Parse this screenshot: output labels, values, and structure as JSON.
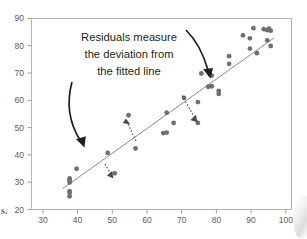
{
  "figure": {
    "background_color": "#ffffff",
    "frame_color": "#b5b5b5",
    "point_color": "#6e6e78",
    "line_color": "#8a8a8a",
    "annotation_color": "#231f20",
    "residual_arrow_color": "#4a4a55"
  },
  "annotation": {
    "line1": "Residuals measure",
    "line2": "the deviation from",
    "line3": "the fitted line",
    "arrow_left_name": "curved-arrow-left",
    "arrow_right_name": "curved-arrow-right"
  },
  "page_artifacts": {
    "text_fragment": "s."
  },
  "chart_data": {
    "type": "scatter",
    "title": "",
    "xlabel": "",
    "ylabel": "",
    "xlim": [
      27,
      102
    ],
    "ylim": [
      18,
      93
    ],
    "xticks": [
      30,
      40,
      50,
      60,
      70,
      80,
      90,
      100
    ],
    "yticks": [
      20,
      30,
      40,
      50,
      60,
      70,
      80,
      90
    ],
    "grid": false,
    "legend": "none",
    "series": [
      {
        "name": "observations",
        "x": [
          38,
          38,
          38,
          38,
          38,
          38,
          40,
          49,
          51,
          55,
          57,
          65,
          66,
          66,
          68,
          71,
          75,
          75,
          76,
          78,
          78.5,
          79,
          79,
          81,
          81,
          84,
          84,
          88,
          90,
          90,
          91,
          92,
          94,
          95,
          95,
          95.5,
          96,
          96
        ],
        "y": [
          23.2,
          24.6,
          25.2,
          28.6,
          29.4,
          30.2,
          34.0,
          40.2,
          32.2,
          55.0,
          42.0,
          48.0,
          56.0,
          48.2,
          52.0,
          61.8,
          60.2,
          52.0,
          71.4,
          66.2,
          71.0,
          70.6,
          66.4,
          64.6,
          63.4,
          78.2,
          75.2,
          86.4,
          85.2,
          81.2,
          89.2,
          79.4,
          88.8,
          88.4,
          84.4,
          89.0,
          88.2,
          82.2
        ]
      }
    ],
    "fit_line": {
      "name": "fitted-regression-line",
      "x_start": 36,
      "y_start": 26.2,
      "x_end": 97,
      "y_end": 85.4
    },
    "residual_arrows": [
      {
        "name": "residual-arrow-up-55",
        "x": 55,
        "y_from": 48.4,
        "y_to": 54.2,
        "direction": "up"
      },
      {
        "name": "residual-arrow-down-75",
        "x_from": 71.5,
        "y_from": 61.4,
        "x_to": 75,
        "y_to": 53.0,
        "direction": "down"
      },
      {
        "name": "residual-arrow-down-51",
        "x_from": 48.8,
        "y_from": 37.6,
        "x_to": 51,
        "y_to": 33.2,
        "direction": "down"
      }
    ]
  }
}
